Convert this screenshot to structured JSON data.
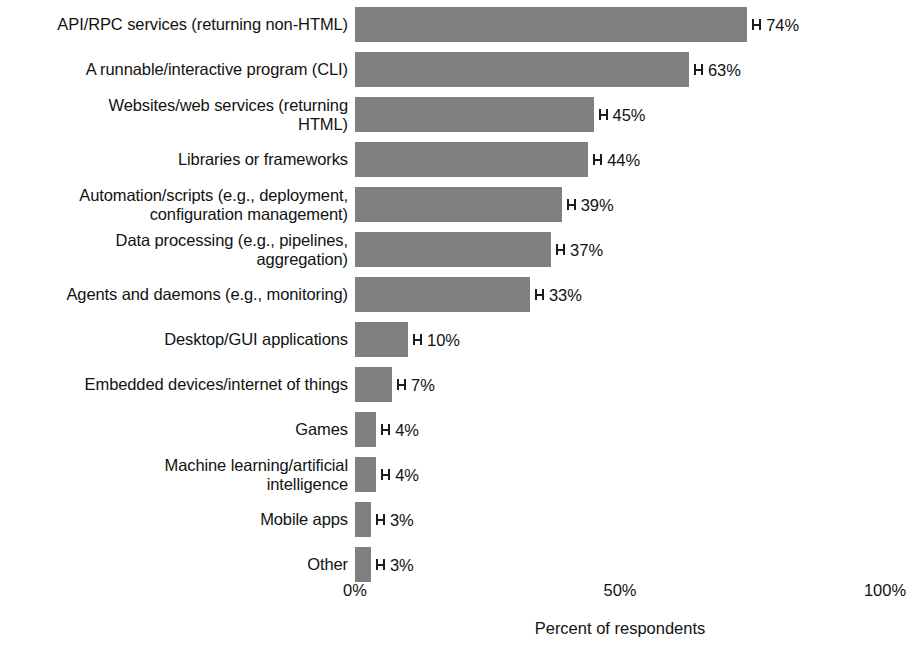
{
  "chart_data": {
    "type": "bar",
    "orientation": "horizontal",
    "title": "",
    "xlabel": "Percent of respondents",
    "ylabel": "",
    "xlim": [
      0,
      100
    ],
    "xticks": [
      "0%",
      "50%",
      "100%"
    ],
    "xtick_values": [
      0,
      50,
      100
    ],
    "grid": false,
    "legend": null,
    "bar_color": "#808080",
    "error_bars": true,
    "categories": [
      "API/RPC services (returning non-HTML)",
      "A runnable/interactive program (CLI)",
      "Websites/web services (returning\nHTML)",
      "Libraries or frameworks",
      "Automation/scripts (e.g., deployment,\nconfiguration management)",
      "Data processing (e.g., pipelines,\naggregation)",
      "Agents and daemons (e.g., monitoring)",
      "Desktop/GUI applications",
      "Embedded devices/internet of things",
      "Games",
      "Machine learning/artificial\nintelligence",
      "Mobile apps",
      "Other"
    ],
    "values": [
      74,
      63,
      45,
      44,
      39,
      37,
      33,
      10,
      7,
      4,
      4,
      3,
      3
    ],
    "value_labels": [
      "74%",
      "63%",
      "45%",
      "44%",
      "39%",
      "37%",
      "33%",
      "10%",
      "7%",
      "4%",
      "4%",
      "3%",
      "3%"
    ]
  },
  "axis": {
    "ticks": [
      {
        "label": "0%",
        "value": 0
      },
      {
        "label": "50%",
        "value": 50
      },
      {
        "label": "100%",
        "value": 100
      }
    ],
    "title": "Percent of respondents"
  }
}
